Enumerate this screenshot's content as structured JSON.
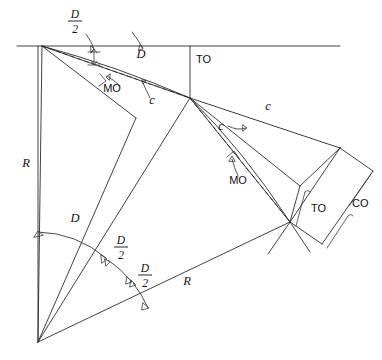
{
  "figure": {
    "kind": "engineering-line-diagram",
    "width": 382,
    "height": 360,
    "background_color": "#ffffff",
    "line_color": "#2b2b2b"
  },
  "labels": {
    "d_half_top": {
      "numerator": "D",
      "denominator": "2",
      "x": 75,
      "y": 18
    },
    "d_top": {
      "text": "D",
      "x": 141,
      "y": 58
    },
    "mo_left": {
      "text": "MO",
      "x": 112,
      "y": 92
    },
    "c_left": {
      "text": "c",
      "x": 152,
      "y": 104
    },
    "to_top": {
      "text": "TO",
      "x": 196,
      "y": 63
    },
    "c_right_long": {
      "text": "c",
      "x": 268,
      "y": 110
    },
    "c_right_inner": {
      "text": "c",
      "x": 221,
      "y": 130
    },
    "mo_right": {
      "text": "MO",
      "x": 238,
      "y": 184
    },
    "to_right": {
      "text": "TO",
      "x": 311,
      "y": 212
    },
    "co_right": {
      "text": "CO",
      "x": 352,
      "y": 207
    },
    "r_left": {
      "text": "R",
      "x": 26,
      "y": 167
    },
    "r_lower": {
      "text": "R",
      "x": 187,
      "y": 285
    },
    "d_angle": {
      "text": "D",
      "x": 75,
      "y": 222
    },
    "d_half_mid": {
      "numerator": "D",
      "denominator": "2",
      "x": 121,
      "y": 244
    },
    "d_half_low": {
      "numerator": "D",
      "denominator": "2",
      "x": 145,
      "y": 272
    }
  },
  "legend_terms": [
    {
      "abbr": "D",
      "meaning": "Deflection angle"
    },
    {
      "abbr": "R",
      "meaning": "Radius"
    },
    {
      "abbr": "c",
      "meaning": "Chord"
    },
    {
      "abbr": "MO",
      "meaning": "Middle ordinate"
    },
    {
      "abbr": "TO",
      "meaning": "Tangent offset"
    },
    {
      "abbr": "CO",
      "meaning": "Chord offset"
    }
  ],
  "geometry": {
    "apex": {
      "x": 42,
      "y": 46
    },
    "center": {
      "x": 38,
      "y": 342
    },
    "mid_station": {
      "x": 190,
      "y": 98
    },
    "far_station": {
      "x": 290,
      "y": 222
    },
    "tangent_line": {
      "x1": 17,
      "y1": 46,
      "x2": 340,
      "y2": 46
    },
    "to_vertical": {
      "x": 190,
      "y1": 46,
      "y2": 98
    }
  }
}
